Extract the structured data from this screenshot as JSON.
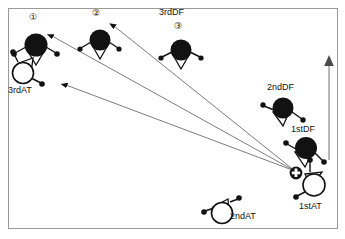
{
  "figure": {
    "title": "",
    "frame": {
      "x": 8,
      "y": 8,
      "width": 330,
      "height": 221,
      "stroke": "#9a9a9a"
    },
    "background": "#ffffff",
    "ink": "#121212"
  },
  "legend_colors": {
    "defender_fill": "#121212",
    "attacker_fill": "#ffffff",
    "outline": "#121212",
    "arrow": "#4a4a4a",
    "frame": "#9a9a9a"
  },
  "labels": [
    {
      "id": "lbl-1",
      "text": "①",
      "x": 31,
      "y": 14,
      "size": 9
    },
    {
      "id": "lbl-2",
      "text": "②",
      "x": 93,
      "y": 10,
      "size": 9
    },
    {
      "id": "lbl-3rddf",
      "text": "3rdDF",
      "x": 160,
      "y": 9,
      "size": 9
    },
    {
      "id": "lbl-3",
      "text": "③",
      "x": 175,
      "y": 23,
      "size": 9
    },
    {
      "id": "lbl-3rdat",
      "text": "3rdAT",
      "x": 9,
      "y": 86,
      "size": 9
    },
    {
      "id": "lbl-2nddf",
      "text": "2ndDF",
      "x": 268,
      "y": 84,
      "size": 9
    },
    {
      "id": "lbl-1stdf",
      "text": "1stDF",
      "x": 292,
      "y": 126,
      "size": 9
    },
    {
      "id": "lbl-1stat",
      "text": "1stAT",
      "x": 300,
      "y": 203,
      "size": 9
    },
    {
      "id": "lbl-2ndat",
      "text": "2ndAT",
      "x": 229,
      "y": 212,
      "size": 9
    }
  ],
  "players": [
    {
      "id": "df-3rd-a",
      "role": "defender",
      "label_ref": "①",
      "x": 36,
      "y": 45,
      "r": 11
    },
    {
      "id": "df-3rd-b",
      "role": "defender",
      "label_ref": "②",
      "x": 100,
      "y": 40,
      "r": 10
    },
    {
      "id": "df-3rd-c",
      "role": "defender",
      "label_ref": "③",
      "x": 181,
      "y": 50,
      "r": 10
    },
    {
      "id": "df-2nd",
      "role": "defender",
      "label_ref": "2ndDF",
      "x": 283,
      "y": 108,
      "r": 10
    },
    {
      "id": "df-1st",
      "role": "defender",
      "label_ref": "1stDF",
      "x": 306,
      "y": 148,
      "r": 11
    },
    {
      "id": "at-3rd",
      "role": "attacker",
      "label_ref": "3rdAT",
      "x": 23,
      "y": 73,
      "r": 11
    },
    {
      "id": "at-1st",
      "role": "attacker",
      "label_ref": "1stAT",
      "x": 313,
      "y": 184,
      "r": 12
    },
    {
      "id": "at-2nd",
      "role": "attacker",
      "label_ref": "2ndAT",
      "x": 222,
      "y": 212,
      "r": 11
    }
  ],
  "ball": {
    "id": "ball",
    "x": 296,
    "y": 173,
    "r": 6,
    "note": "ball-marker"
  },
  "arrows": [
    {
      "id": "pass-arrow-1",
      "from_x": 295,
      "from_y": 172,
      "to_x": 47,
      "to_y": 32
    },
    {
      "id": "pass-arrow-2",
      "from_x": 295,
      "from_y": 172,
      "to_x": 110,
      "to_y": 23
    },
    {
      "id": "pass-arrow-3",
      "from_x": 295,
      "from_y": 172,
      "to_x": 61,
      "to_y": 83
    }
  ],
  "axis_marker": {
    "id": "vertical-axis-arrow",
    "x": 329,
    "y_top": 58,
    "y_bottom": 160
  }
}
